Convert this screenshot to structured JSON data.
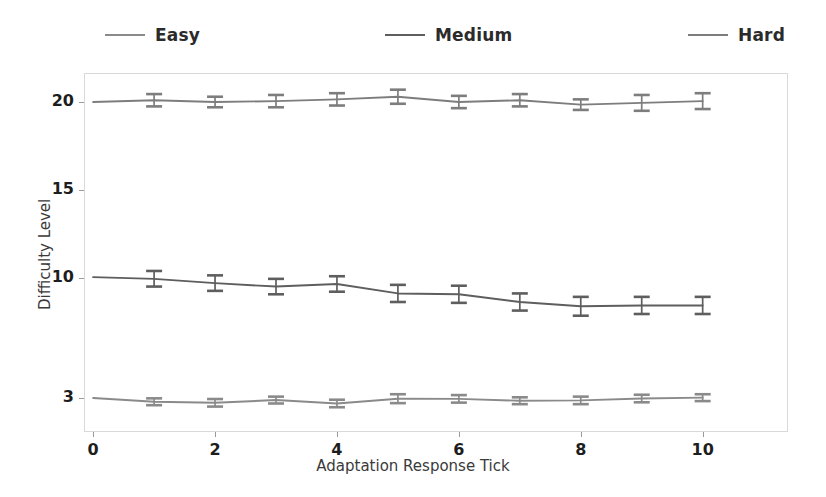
{
  "chart_data": {
    "type": "line",
    "title": "",
    "xlabel": "Adaptation Response Tick",
    "ylabel": "Difficulty Level",
    "x": [
      0,
      1,
      2,
      3,
      4,
      5,
      6,
      7,
      8,
      9,
      10
    ],
    "xticks": [
      0,
      2,
      4,
      6,
      8,
      10
    ],
    "yticks": [
      3,
      10,
      15,
      20
    ],
    "xlim": [
      -0.15,
      11.4
    ],
    "ylim": [
      0.6,
      22.4
    ],
    "grid": false,
    "legend_position": "above-plot",
    "errorbars": true,
    "series": [
      {
        "name": "Easy",
        "color": "#8a8a8a",
        "values": [
          3.0,
          2.78,
          2.72,
          2.88,
          2.68,
          2.96,
          2.95,
          2.84,
          2.86,
          2.97,
          3.02
        ],
        "errors": [
          0.0,
          0.2,
          0.22,
          0.2,
          0.22,
          0.26,
          0.22,
          0.2,
          0.22,
          0.22,
          0.2
        ]
      },
      {
        "name": "Medium",
        "color": "#5e5e5e",
        "values": [
          10.05,
          9.95,
          9.7,
          9.5,
          9.65,
          9.1,
          9.05,
          8.6,
          8.35,
          8.4,
          8.4
        ],
        "errors": [
          0.0,
          0.45,
          0.45,
          0.45,
          0.45,
          0.5,
          0.5,
          0.5,
          0.55,
          0.5,
          0.5
        ]
      },
      {
        "name": "Hard",
        "color": "#7d7d7d",
        "values": [
          20.0,
          20.1,
          20.0,
          20.05,
          20.15,
          20.3,
          20.0,
          20.1,
          19.85,
          19.95,
          20.05
        ],
        "errors": [
          0.0,
          0.35,
          0.3,
          0.35,
          0.35,
          0.4,
          0.35,
          0.35,
          0.3,
          0.45,
          0.45
        ]
      }
    ]
  },
  "legend": {
    "items": [
      {
        "label": "Easy",
        "color": "#8a8a8a"
      },
      {
        "label": "Medium",
        "color": "#5e5e5e"
      },
      {
        "label": "Hard",
        "color": "#7d7d7d"
      }
    ]
  },
  "axes": {
    "x_tick_labels": [
      "0",
      "2",
      "4",
      "6",
      "8",
      "10"
    ],
    "y_tick_labels": [
      "3",
      "10",
      "15",
      "20"
    ],
    "x_axis_title": "Adaptation Response Tick",
    "y_axis_title": "Difficulty Level"
  },
  "colors": {
    "frame": "#d9d9d9",
    "tick_text": "#1d1d1d",
    "axis_title": "#3a3a3a",
    "background": "#ffffff"
  }
}
